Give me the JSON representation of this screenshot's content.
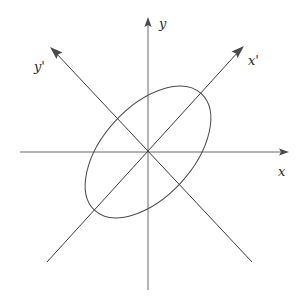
{
  "figure": {
    "background_color": "#ffffff",
    "width": 301,
    "height": 302,
    "origin": {
      "x": 148,
      "y": 152
    }
  },
  "axes": {
    "x": {
      "label": "x",
      "icon": "arrow-right-icon",
      "color": "#6b6b6b",
      "from": {
        "x": 20,
        "y": 152
      },
      "to": {
        "x": 288,
        "y": 152
      },
      "label_position": {
        "x": 283,
        "y": 172
      }
    },
    "y": {
      "label": "y",
      "icon": "arrow-up-icon",
      "color": "#6b6b6b",
      "from": {
        "x": 148,
        "y": 290
      },
      "to": {
        "x": 148,
        "y": 18
      },
      "label_position": {
        "x": 163,
        "y": 25
      }
    },
    "x_prime": {
      "label": "x'",
      "icon": "arrow-up-right-icon",
      "color": "#3c3c3c",
      "from": {
        "x": 47,
        "y": 262
      },
      "to": {
        "x": 243,
        "y": 47
      },
      "label_position": {
        "x": 253,
        "y": 62
      },
      "angle_degrees": 47.6
    },
    "y_prime": {
      "label": "y'",
      "icon": "arrow-up-left-icon",
      "color": "#3c3c3c",
      "from": {
        "x": 252,
        "y": 262
      },
      "to": {
        "x": 51,
        "y": 48
      },
      "label_position": {
        "x": 42,
        "y": 68
      },
      "angle_degrees": 133.2
    }
  },
  "conic": {
    "shape": "ellipse",
    "color": "#4a4a4a",
    "center": {
      "x": 148,
      "y": 152
    },
    "semi_major_axis": 79,
    "semi_minor_axis": 45,
    "rotation_degrees": -47.6
  }
}
